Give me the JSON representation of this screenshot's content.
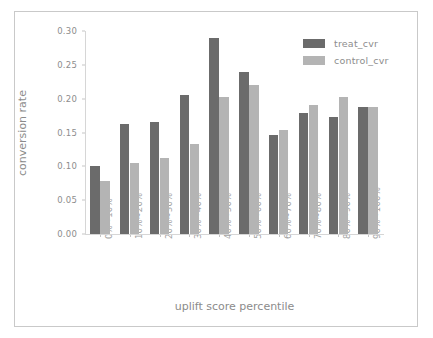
{
  "chart_data": {
    "type": "bar",
    "title": "",
    "xlabel": "uplift score percentile",
    "ylabel": "conversion rate",
    "categories": [
      "0%~10%",
      "10%~20%",
      "20%~30%",
      "30%~40%",
      "40%~50%",
      "50%~60%",
      "60%~70%",
      "70%~80%",
      "80%~90%",
      "90%~100%"
    ],
    "series": [
      {
        "name": "treat_cvr",
        "color": "#6b6b6b",
        "values": [
          0.1,
          0.163,
          0.165,
          0.206,
          0.289,
          0.239,
          0.147,
          0.179,
          0.173,
          0.187
        ]
      },
      {
        "name": "control_cvr",
        "color": "#b4b4b4",
        "values": [
          0.079,
          0.105,
          0.112,
          0.133,
          0.203,
          0.22,
          0.153,
          0.19,
          0.203,
          0.188
        ]
      }
    ],
    "ylim": [
      0.0,
      0.3
    ],
    "yticks": [
      "0.00",
      "0.05",
      "0.10",
      "0.15",
      "0.20",
      "0.25",
      "0.30"
    ],
    "ytick_values": [
      0.0,
      0.05,
      0.1,
      0.15,
      0.2,
      0.25,
      0.3
    ],
    "grid": false,
    "legend_position": "top-right"
  },
  "figure": {
    "background_color": "#ffffff",
    "border_color": "#c9c9c9",
    "axis_color": "#d6d6d6",
    "tick_label_color": "#8d8d8d",
    "axis_label_color": "#8b8b8b"
  }
}
